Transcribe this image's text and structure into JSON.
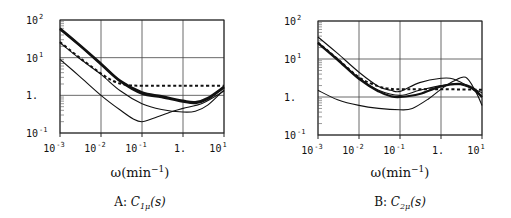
{
  "chart_data": [
    {
      "type": "line",
      "panel": "A",
      "caption_prefix": "A: ",
      "caption_symbol": "C",
      "caption_sub": "1μ",
      "caption_suffix": "(s)",
      "xlabel_main": "ω(min",
      "xlabel_sup": "−1",
      "xlabel_end": ")",
      "xscale": "log",
      "yscale": "log",
      "xlim": [
        0.001,
        10
      ],
      "ylim": [
        0.1,
        100
      ],
      "grid": true,
      "xticks": [
        {
          "value": 0.001,
          "base": "10",
          "exp": "-3"
        },
        {
          "value": 0.01,
          "base": "10",
          "exp": "-2"
        },
        {
          "value": 0.1,
          "base": "10",
          "exp": "-1"
        },
        {
          "value": 1,
          "base": "1.",
          "exp": ""
        },
        {
          "value": 10,
          "base": "10",
          "exp": "1"
        }
      ],
      "yticks": [
        {
          "value": 100,
          "base": "10",
          "exp": "2"
        },
        {
          "value": 10,
          "base": "10",
          "exp": "1"
        },
        {
          "value": 1,
          "base": "1.",
          "exp": ""
        },
        {
          "value": 0.1,
          "base": "10",
          "exp": "-1"
        }
      ],
      "series": [
        {
          "name": "thick-1",
          "style": "thick",
          "x": [
            0.001,
            0.003,
            0.01,
            0.03,
            0.1,
            0.3,
            1,
            2,
            4,
            10
          ],
          "y": [
            60,
            22,
            7,
            2.4,
            1.2,
            0.95,
            0.72,
            0.66,
            0.85,
            1.7
          ]
        },
        {
          "name": "thick-2",
          "style": "thick",
          "x": [
            0.001,
            0.003,
            0.01,
            0.03,
            0.1,
            0.3,
            1,
            2,
            4,
            10
          ],
          "y": [
            57,
            21,
            6.6,
            2.3,
            1.1,
            0.9,
            0.68,
            0.62,
            0.8,
            1.6
          ]
        },
        {
          "name": "dotted",
          "style": "dotted",
          "x": [
            0.001,
            0.003,
            0.01,
            0.02,
            0.04,
            0.1,
            1,
            10
          ],
          "y": [
            26,
            10,
            3.8,
            2.4,
            1.9,
            1.8,
            1.8,
            1.8
          ]
        },
        {
          "name": "thin-middle",
          "style": "thin",
          "x": [
            0.001,
            0.003,
            0.01,
            0.03,
            0.1,
            0.3,
            1,
            2,
            4,
            10
          ],
          "y": [
            25,
            9.5,
            3.6,
            1.3,
            0.6,
            0.42,
            0.36,
            0.38,
            0.55,
            1.4
          ]
        },
        {
          "name": "thin-bottom",
          "style": "thin",
          "x": [
            0.001,
            0.003,
            0.01,
            0.03,
            0.06,
            0.1,
            0.2,
            0.5,
            1,
            3,
            10
          ],
          "y": [
            9,
            3.2,
            1.0,
            0.4,
            0.24,
            0.2,
            0.25,
            0.36,
            0.45,
            0.62,
            1.3
          ]
        }
      ]
    },
    {
      "type": "line",
      "panel": "B",
      "caption_prefix": "B: ",
      "caption_symbol": "C",
      "caption_sub": "2μ",
      "caption_suffix": "(s)",
      "xlabel_main": "ω(min",
      "xlabel_sup": "−1",
      "xlabel_end": ")",
      "xscale": "log",
      "yscale": "log",
      "xlim": [
        0.001,
        10
      ],
      "ylim": [
        0.1,
        100
      ],
      "grid": true,
      "xticks": [
        {
          "value": 0.001,
          "base": "10",
          "exp": "-3"
        },
        {
          "value": 0.01,
          "base": "10",
          "exp": "-2"
        },
        {
          "value": 0.1,
          "base": "10",
          "exp": "-1"
        },
        {
          "value": 1,
          "base": "1.",
          "exp": ""
        },
        {
          "value": 10,
          "base": "10",
          "exp": "1"
        }
      ],
      "yticks": [
        {
          "value": 100,
          "base": "10",
          "exp": "2"
        },
        {
          "value": 10,
          "base": "10",
          "exp": "1"
        },
        {
          "value": 1,
          "base": "1.",
          "exp": ""
        },
        {
          "value": 0.1,
          "base": "10",
          "exp": "-1"
        }
      ],
      "series": [
        {
          "name": "thin-top",
          "style": "thin",
          "x": [
            0.001,
            0.003,
            0.01,
            0.03,
            0.06,
            0.1,
            0.3,
            1,
            2,
            5,
            10
          ],
          "y": [
            38,
            14,
            4.5,
            1.9,
            1.5,
            1.4,
            2.4,
            3.1,
            3.0,
            1.8,
            1.0
          ]
        },
        {
          "name": "thick",
          "style": "thick",
          "x": [
            0.001,
            0.003,
            0.01,
            0.03,
            0.06,
            0.1,
            0.3,
            1,
            3,
            6,
            10
          ],
          "y": [
            26,
            9.5,
            3.0,
            1.4,
            1.05,
            1.0,
            1.2,
            1.9,
            2.2,
            1.7,
            1.0
          ]
        },
        {
          "name": "thin-second",
          "style": "thin",
          "x": [
            0.001,
            0.003,
            0.01,
            0.03,
            0.1,
            0.3,
            1,
            3,
            10
          ],
          "y": [
            27,
            10,
            3.2,
            1.5,
            1.1,
            1.5,
            2.0,
            2.1,
            1.3
          ]
        },
        {
          "name": "dotted",
          "style": "dotted",
          "x": [
            0.001,
            0.003,
            0.01,
            0.03,
            0.06,
            0.1,
            1,
            10
          ],
          "y": [
            27,
            10,
            3.3,
            1.9,
            1.65,
            1.6,
            1.6,
            1.55
          ]
        },
        {
          "name": "thin-bottom",
          "style": "thin",
          "x": [
            0.001,
            0.003,
            0.01,
            0.03,
            0.1,
            0.2,
            0.5,
            1,
            2,
            4,
            7,
            10
          ],
          "y": [
            1.5,
            0.85,
            0.6,
            0.5,
            0.46,
            0.5,
            0.9,
            1.6,
            2.6,
            3.3,
            1.4,
            0.6
          ]
        }
      ]
    }
  ]
}
